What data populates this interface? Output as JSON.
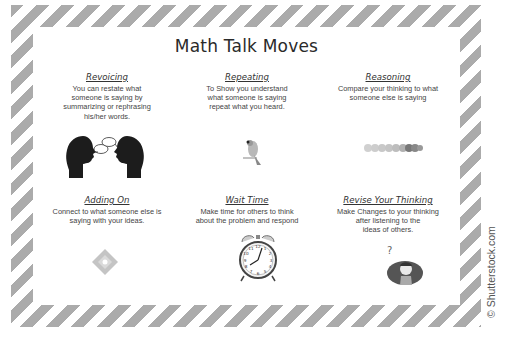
{
  "poster": {
    "title": "Math Talk Moves",
    "colors": {
      "stripe": "#ababab",
      "background": "#ffffff",
      "text": "#333333"
    },
    "moves": [
      {
        "heading": "Revoicing",
        "description": "You can restate what\nsomeone is saying by\nsummarizing or rephrasing\nhis/her words.",
        "icon": "two-heads-talking-icon"
      },
      {
        "heading": "Repeating",
        "description": "To Show you understand\nwhat someone is saying\nrepeat what you heard.",
        "icon": "parrot-icon"
      },
      {
        "heading": "Reasoning",
        "description": "Compare your thinking to what\nsomeone else is saying",
        "icon": "beads-row-icon"
      },
      {
        "heading": "Adding On",
        "description": "Connect to what someone else is\nsaying with your ideas.",
        "icon": "puzzle-cross-icon"
      },
      {
        "heading": "Wait Time",
        "description": "Make time for others to think\nabout the problem and respond",
        "icon": "alarm-clock-icon"
      },
      {
        "heading": "Revise Your Thinking",
        "description": "Make Changes to your thinking\nafter listening to the\nideas of others.",
        "icon": "thinking-boy-icon"
      }
    ]
  },
  "watermark": "© Shutterstock.com"
}
